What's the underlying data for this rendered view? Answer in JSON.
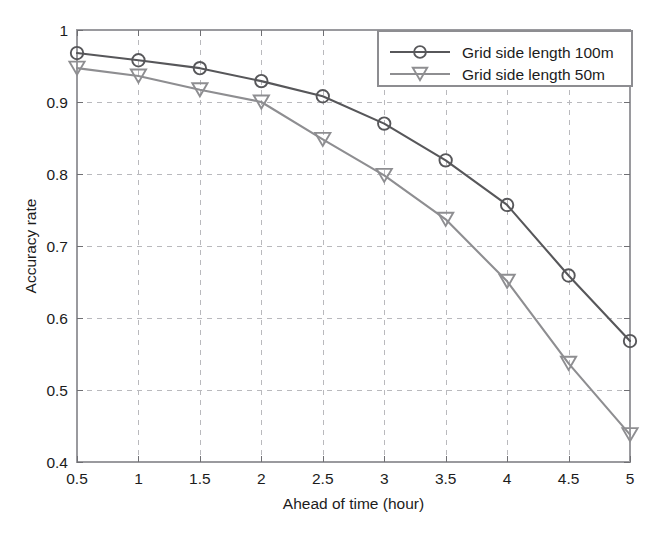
{
  "chart_data": {
    "type": "line",
    "title": "",
    "xlabel": "Ahead of time (hour)",
    "ylabel": "Accuracy rate",
    "x": [
      0.5,
      1,
      1.5,
      2,
      2.5,
      3,
      3.5,
      4,
      4.5,
      5
    ],
    "xticklabels": [
      "0.5",
      "1",
      "1.5",
      "2",
      "2.5",
      "3",
      "3.5",
      "4",
      "4.5",
      "5"
    ],
    "yticklabels": [
      "0.4",
      "0.5",
      "0.6",
      "0.7",
      "0.8",
      "0.9",
      "1"
    ],
    "yticks": [
      0.4,
      0.5,
      0.6,
      0.7,
      0.8,
      0.9,
      1
    ],
    "xlim": [
      0.5,
      5
    ],
    "ylim": [
      0.4,
      1
    ],
    "grid": true,
    "legend_position": "upper right",
    "series": [
      {
        "name": "Grid side length 100m",
        "marker": "circle",
        "color": "#57575a",
        "values": [
          0.968,
          0.958,
          0.947,
          0.929,
          0.908,
          0.87,
          0.819,
          0.757,
          0.659,
          0.568
        ]
      },
      {
        "name": "Grid side length 50m",
        "marker": "triangle-down",
        "color": "#8e8e91",
        "values": [
          0.947,
          0.936,
          0.917,
          0.9,
          0.848,
          0.798,
          0.737,
          0.651,
          0.537,
          0.438
        ]
      }
    ]
  },
  "axes": {
    "x_title": "Ahead of time (hour)",
    "y_title": "Accuracy rate"
  },
  "legend": {
    "entries": [
      {
        "label": "Grid side length 100m"
      },
      {
        "label": "Grid side length 50m"
      }
    ]
  }
}
